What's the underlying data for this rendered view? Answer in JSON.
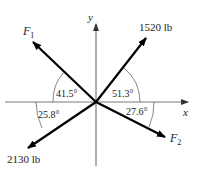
{
  "diagram": {
    "axes": {
      "x_label": "x",
      "y_label": "y"
    },
    "forces": [
      {
        "id": "F1",
        "label": "F",
        "subscript": "1",
        "angle_label": "41.5°",
        "reference": "from -x axis, measured toward +y"
      },
      {
        "id": "1520",
        "label": "1520 lb",
        "angle_label": "51.3°",
        "reference": "from +x axis, measured toward +y"
      },
      {
        "id": "2130",
        "label": "2130 lb",
        "angle_label": "25.8°",
        "reference": "from -x axis, measured toward -y"
      },
      {
        "id": "F2",
        "label": "F",
        "subscript": "2",
        "angle_label": "27.6°",
        "reference": "from +x axis, measured toward -y"
      }
    ],
    "colors": {
      "axis": "#7a7a7a",
      "vector": "#000000",
      "arc": "#555555",
      "text": "#222222"
    }
  }
}
